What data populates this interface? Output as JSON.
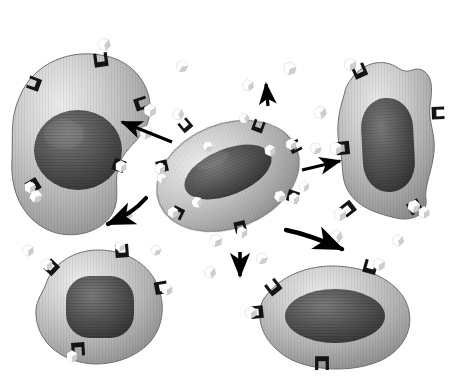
{
  "figure": {
    "title": "Paracrine cell signalling diagram",
    "caption": "",
    "background_color": "#ffffff",
    "render_style": "grayscale 3D rendered biological illustration",
    "top_bar": {
      "name": "top-gray-bar",
      "color": "#a8a8a8",
      "x": 100,
      "y": 0,
      "width": 350,
      "height": 6
    }
  },
  "palette": {
    "cell_membrane_light": "#d8d8d8",
    "cell_membrane_mid": "#b0b0b0",
    "cell_membrane_dark": "#8c8c8c",
    "cell_outline": "#6e6e6e",
    "nucleus_light": "#6f6f6f",
    "nucleus_dark": "#3a3a3a",
    "receptor_dark": "#1b1b1b",
    "ligand_light": "#fbfbfb",
    "ligand_shadow": "#b9b9b9",
    "arrow_black": "#000000",
    "background": "#ffffff"
  },
  "cells": [
    {
      "id": "cell-signalling-center",
      "label": "Signalling cell",
      "role": "secretes ligand molecules",
      "cx": 228,
      "cy": 175,
      "rx": 72,
      "ry": 50,
      "rotation": -22,
      "nucleus": {
        "rx": 44,
        "ry": 22,
        "rotation": -22
      },
      "receptor_count": 7
    },
    {
      "id": "cell-target-upper-left",
      "label": "Target cell (upper left)",
      "role": "receives signal",
      "cx": 82,
      "cy": 140,
      "rx": 66,
      "ry": 60,
      "rotation": 12,
      "nucleus": {
        "rx": 40,
        "ry": 36,
        "rotation": 8
      },
      "receptor_count": 5
    },
    {
      "id": "cell-target-upper-right",
      "label": "Target cell (upper right)",
      "role": "receives signal",
      "cx": 382,
      "cy": 140,
      "rx": 48,
      "ry": 72,
      "rotation": -6,
      "nucleus": {
        "rx": 27,
        "ry": 48,
        "rotation": -4
      },
      "receptor_count": 6
    },
    {
      "id": "cell-target-lower-left",
      "label": "Target cell (lower left)",
      "role": "receives signal",
      "cx": 96,
      "cy": 312,
      "rx": 58,
      "ry": 52,
      "rotation": -8,
      "nucleus": {
        "rx": 36,
        "ry": 30,
        "rotation": -6
      },
      "receptor_count": 5
    },
    {
      "id": "cell-target-lower-right",
      "label": "Target cell (lower right)",
      "role": "receives signal",
      "cx": 330,
      "cy": 318,
      "rx": 72,
      "ry": 48,
      "rotation": -5,
      "nucleus": {
        "rx": 45,
        "ry": 25,
        "rotation": -5
      },
      "receptor_count": 5
    }
  ],
  "ligands": {
    "name": "ligand-molecule",
    "description": "small white cube-shaped signalling molecules",
    "count": 26,
    "positions": [
      {
        "x": 104,
        "y": 44,
        "s": 10,
        "r": -18
      },
      {
        "x": 182,
        "y": 66,
        "s": 9,
        "r": 24
      },
      {
        "x": 248,
        "y": 85,
        "s": 9,
        "r": -10
      },
      {
        "x": 290,
        "y": 68,
        "s": 10,
        "r": 14
      },
      {
        "x": 178,
        "y": 114,
        "s": 9,
        "r": -28
      },
      {
        "x": 146,
        "y": 132,
        "s": 10,
        "r": 8
      },
      {
        "x": 320,
        "y": 112,
        "s": 10,
        "r": -14
      },
      {
        "x": 316,
        "y": 148,
        "s": 9,
        "r": 20
      },
      {
        "x": 270,
        "y": 150,
        "s": 9,
        "r": -8
      },
      {
        "x": 280,
        "y": 196,
        "s": 9,
        "r": 16
      },
      {
        "x": 197,
        "y": 202,
        "s": 9,
        "r": -22
      },
      {
        "x": 162,
        "y": 178,
        "s": 8,
        "r": 10
      },
      {
        "x": 126,
        "y": 214,
        "s": 10,
        "r": -12
      },
      {
        "x": 36,
        "y": 196,
        "s": 10,
        "r": 18
      },
      {
        "x": 28,
        "y": 250,
        "s": 9,
        "r": -6
      },
      {
        "x": 216,
        "y": 240,
        "s": 10,
        "r": 12
      },
      {
        "x": 210,
        "y": 272,
        "s": 9,
        "r": -16
      },
      {
        "x": 262,
        "y": 258,
        "s": 9,
        "r": 22
      },
      {
        "x": 336,
        "y": 236,
        "s": 10,
        "r": -20
      },
      {
        "x": 414,
        "y": 206,
        "s": 10,
        "r": 10
      },
      {
        "x": 398,
        "y": 240,
        "s": 9,
        "r": -14
      },
      {
        "x": 120,
        "y": 246,
        "s": 8,
        "r": 6
      },
      {
        "x": 244,
        "y": 118,
        "s": 8,
        "r": -26
      },
      {
        "x": 208,
        "y": 146,
        "s": 8,
        "r": 30
      },
      {
        "x": 304,
        "y": 186,
        "s": 8,
        "r": -4
      },
      {
        "x": 156,
        "y": 250,
        "s": 8,
        "r": 16
      }
    ]
  },
  "arrows": [
    {
      "name": "arrow-to-upper-left",
      "direction": "up-left",
      "from": [
        172,
        142
      ],
      "to": [
        118,
        122
      ],
      "curved": false
    },
    {
      "name": "arrow-to-top",
      "direction": "up",
      "from": [
        268,
        104
      ],
      "to": [
        266,
        80
      ],
      "curved": false
    },
    {
      "name": "arrow-to-upper-right",
      "direction": "right",
      "from": [
        300,
        168
      ],
      "to": [
        342,
        160
      ],
      "curved": false
    },
    {
      "name": "arrow-to-lower-left",
      "direction": "down-left",
      "from": [
        148,
        198
      ],
      "to": [
        104,
        224
      ],
      "curved": true
    },
    {
      "name": "arrow-to-bottom",
      "direction": "down",
      "from": [
        240,
        250
      ],
      "to": [
        240,
        278
      ],
      "curved": false
    },
    {
      "name": "arrow-to-lower-right",
      "direction": "down-right",
      "from": [
        286,
        228
      ],
      "to": [
        344,
        248
      ],
      "curved": true
    }
  ],
  "receptors": {
    "name": "membrane-receptor",
    "description": "dark U-shaped transmembrane receptors on cell surfaces",
    "color": "#1b1b1b"
  },
  "annotations": {
    "has_text_labels": false,
    "visible_text": []
  }
}
